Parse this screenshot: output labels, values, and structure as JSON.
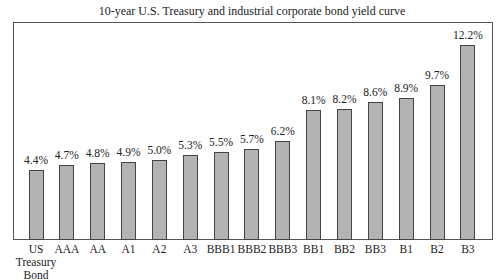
{
  "chart_data": {
    "type": "bar",
    "title": "10-year U.S. Treasury and industrial corporate bond yield curve",
    "xlabel": "",
    "ylabel": "",
    "categories": [
      "US Treasury Bond",
      "AAA",
      "AA",
      "A1",
      "A2",
      "A3",
      "BBB1",
      "BBB2",
      "BBB3",
      "BB1",
      "BB2",
      "BB3",
      "B1",
      "B2",
      "B3"
    ],
    "values": [
      4.4,
      4.7,
      4.8,
      4.9,
      5.0,
      5.3,
      5.5,
      5.7,
      6.2,
      8.1,
      8.2,
      8.6,
      8.9,
      9.7,
      12.2
    ],
    "value_labels": [
      "4.4%",
      "4.7%",
      "4.8%",
      "4.9%",
      "5.0%",
      "5.3%",
      "5.5%",
      "5.7%",
      "6.2%",
      "8.1%",
      "8.2%",
      "8.6%",
      "8.9%",
      "9.7%",
      "12.2%"
    ],
    "ylim": [
      0,
      13.5
    ],
    "grid": false,
    "legend": "none",
    "bar_color": "#b3b3b3"
  },
  "labels": {
    "title": "10-year U.S. Treasury and industrial corporate bond yield curve",
    "cat_lines": [
      [
        "US",
        "Treasury",
        "Bond"
      ],
      [
        "AAA"
      ],
      [
        "AA"
      ],
      [
        "A1"
      ],
      [
        "A2"
      ],
      [
        "A3"
      ],
      [
        "BBB1"
      ],
      [
        "BBB2"
      ],
      [
        "BBB3"
      ],
      [
        "BB1"
      ],
      [
        "BB2"
      ],
      [
        "BB3"
      ],
      [
        "B1"
      ],
      [
        "B2"
      ],
      [
        "B3"
      ]
    ]
  }
}
